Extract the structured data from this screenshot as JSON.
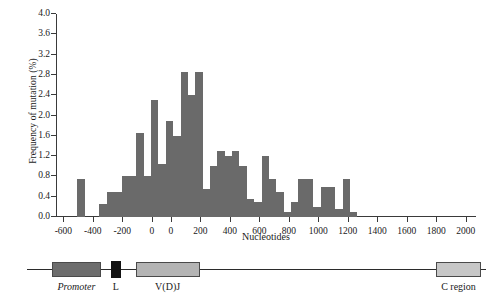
{
  "figure": {
    "background": "#ffffff",
    "bar_color": "#6a6a6a",
    "axis_color": "#3a3a3a"
  },
  "chart_data": {
    "type": "bar",
    "title": "",
    "xlabel": "Nucleotides",
    "ylabel": "Frequency of mutation (%)",
    "ylim": [
      0.0,
      4.0
    ],
    "ytick_labels": [
      "0.0",
      "0.4",
      "0.8",
      "1.2",
      "1.6",
      "2.0",
      "2.4",
      "2.8",
      "3.2",
      "3.6",
      "4.0"
    ],
    "ytick_values": [
      0.0,
      0.4,
      0.8,
      1.2,
      1.6,
      2.0,
      2.4,
      2.8,
      3.2,
      3.6,
      4.0
    ],
    "xtick_labels": [
      "-600",
      "-400",
      "-200",
      "0",
      "0",
      "200",
      "400",
      "600",
      "800",
      "1000",
      "1200",
      "1400",
      "1600",
      "1800",
      "2000"
    ],
    "xtick_positions": [
      -600,
      -400,
      -200,
      0,
      130,
      330,
      530,
      730,
      930,
      1130,
      1330,
      1530,
      1730,
      1930,
      2130
    ],
    "axis_break_note": "x axis has a break between the two 0 labels",
    "grid": false,
    "legend": null,
    "bin_width": 50,
    "bars": [
      {
        "x": -530,
        "value": 0.0
      },
      {
        "x": -480,
        "value": 0.75
      },
      {
        "x": -430,
        "value": 0.0
      },
      {
        "x": -380,
        "value": 0.0
      },
      {
        "x": -330,
        "value": 0.25
      },
      {
        "x": -280,
        "value": 0.5
      },
      {
        "x": -230,
        "value": 0.5
      },
      {
        "x": -180,
        "value": 0.8
      },
      {
        "x": -130,
        "value": 0.8
      },
      {
        "x": -80,
        "value": 1.65
      },
      {
        "x": -30,
        "value": 0.8
      },
      {
        "x": 20,
        "value": 2.3
      },
      {
        "x": 70,
        "value": 1.05
      },
      {
        "x": 120,
        "value": 1.9
      },
      {
        "x": 170,
        "value": 1.6
      },
      {
        "x": 220,
        "value": 2.85
      },
      {
        "x": 270,
        "value": 2.4
      },
      {
        "x": 320,
        "value": 2.85
      },
      {
        "x": 370,
        "value": 0.55
      },
      {
        "x": 420,
        "value": 1.0
      },
      {
        "x": 470,
        "value": 1.3
      },
      {
        "x": 520,
        "value": 1.2
      },
      {
        "x": 570,
        "value": 1.3
      },
      {
        "x": 620,
        "value": 1.0
      },
      {
        "x": 670,
        "value": 0.35
      },
      {
        "x": 720,
        "value": 0.3
      },
      {
        "x": 770,
        "value": 1.2
      },
      {
        "x": 820,
        "value": 0.75
      },
      {
        "x": 870,
        "value": 0.5
      },
      {
        "x": 920,
        "value": 0.1
      },
      {
        "x": 970,
        "value": 0.3
      },
      {
        "x": 1020,
        "value": 0.75
      },
      {
        "x": 1070,
        "value": 0.75
      },
      {
        "x": 1120,
        "value": 0.2
      },
      {
        "x": 1170,
        "value": 0.6
      },
      {
        "x": 1220,
        "value": 0.6
      },
      {
        "x": 1270,
        "value": 0.15
      },
      {
        "x": 1320,
        "value": 0.75
      },
      {
        "x": 1370,
        "value": 0.1
      },
      {
        "x": 1420,
        "value": 0.0
      }
    ]
  },
  "gene_map": {
    "elements": [
      {
        "name": "promoter",
        "label": "Promoter",
        "style": "italic",
        "fill": "#6d6d6d",
        "start": 0.105,
        "end": 0.205
      },
      {
        "name": "leader",
        "label": "L",
        "style": "normal",
        "fill": "#121212",
        "start": 0.225,
        "end": 0.245
      },
      {
        "name": "vdj",
        "label": "V(D)J",
        "style": "normal",
        "fill": "#b4b4b4",
        "start": 0.275,
        "end": 0.405
      },
      {
        "name": "c-region",
        "label": "C region",
        "style": "normal",
        "fill": "#c7c7c7",
        "start": 0.885,
        "end": 0.975
      }
    ],
    "line_start": 0.055,
    "line_end": 0.985
  }
}
